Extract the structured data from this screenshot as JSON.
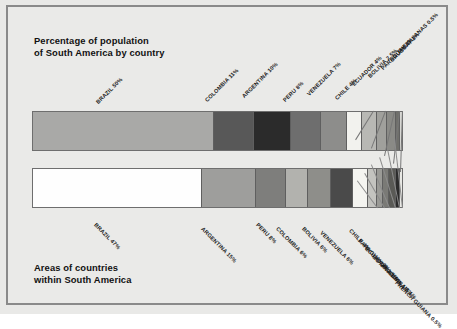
{
  "figure": {
    "background_color": "#eaeae8",
    "frame_color": "#8a8a8a"
  },
  "top_chart": {
    "title": "Percentage of population\nof South America by country"
  },
  "bottom_chart": {
    "title": "Areas of countries\nwithin South America"
  },
  "chart_data": [
    {
      "type": "bar",
      "orientation": "horizontal-stacked",
      "title": "Percentage of population of South America by country",
      "xlabel": "",
      "ylabel": "",
      "xlim": [
        0,
        100
      ],
      "grid": false,
      "legend": "none",
      "categories": [
        "BRAZIL",
        "COLOMBIA",
        "ARGENTINA",
        "PERU",
        "VENEZUELA",
        "CHILE",
        "ECUADOR",
        "BOLIVIA",
        "PARAGUAY",
        "URUGUAY",
        "THE GUIANAS"
      ],
      "values": [
        50,
        11,
        10,
        8,
        7,
        4,
        4,
        2.5,
        2,
        1,
        0.5
      ],
      "labels": [
        "BRAZIL 50%",
        "COLOMBIA 11%",
        "ARGENTINA 10%",
        "PERU 8%",
        "VENEZUELA 7%",
        "CHILE 4%",
        "ECUADOR 4%",
        "BOLIVIA 2.5%",
        "PARAGUAY 2%",
        "URUGUAY 1%",
        "THE GUIANAS 0.5%"
      ],
      "colors": [
        "#a9a9a7",
        "#585858",
        "#2b2b2b",
        "#6e6e6e",
        "#8d8d8b",
        "#f2f2ee",
        "#b8b8b4",
        "#a0a09c",
        "#8a8a86",
        "#6f6f6b",
        "#d7d7d3"
      ]
    },
    {
      "type": "bar",
      "orientation": "horizontal-stacked",
      "title": "Areas of countries within South America",
      "xlabel": "",
      "ylabel": "",
      "xlim": [
        0,
        100
      ],
      "grid": false,
      "legend": "none",
      "categories": [
        "BRAZIL",
        "ARGENTINA",
        "PERU",
        "COLOMBIA",
        "BOLIVIA",
        "VENEZUELA",
        "CHILE",
        "PARAGUAY",
        "ECUADOR",
        "GUYANA",
        "URUGUAY",
        "SURINAM",
        "FRENCH GUIANA"
      ],
      "values": [
        47,
        15,
        8,
        6,
        6,
        6,
        4,
        2,
        1.5,
        1.5,
        1.5,
        1,
        0.5
      ],
      "labels": [
        "BRAZIL 47%",
        "ARGENTINA 15%",
        "PERU 8%",
        "COLOMBIA 6%",
        "BOLIVIA 6%",
        "VENEZUELA 6%",
        "CHILE 4%",
        "PARAGUAY 2%",
        "ECUADOR 1.5%",
        "GUYANA 1.5%",
        "URUGUAY 1.5%",
        "SURINAM 1%",
        "FRENCH GUIANA 0.5%"
      ],
      "colors": [
        "#fefefe",
        "#9e9e9c",
        "#7e7e7c",
        "#b2b2ae",
        "#8e8e8a",
        "#4a4a4a",
        "#f4f4f0",
        "#c3c3bf",
        "#9a9a96",
        "#7a7a76",
        "#5a5a56",
        "#2c2c2c",
        "#e8e8e4"
      ]
    }
  ]
}
